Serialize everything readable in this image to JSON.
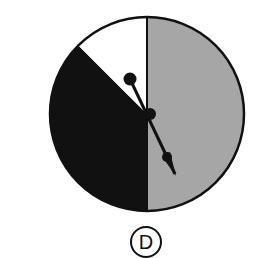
{
  "diagram": {
    "type": "spinner",
    "sections": [
      {
        "name": "gray",
        "color": "#a6a6a6",
        "fraction": 0.5
      },
      {
        "name": "black",
        "color": "#111111",
        "fraction": 0.375
      },
      {
        "name": "white",
        "color": "#ffffff",
        "fraction": 0.125
      }
    ],
    "option_label": "D"
  }
}
